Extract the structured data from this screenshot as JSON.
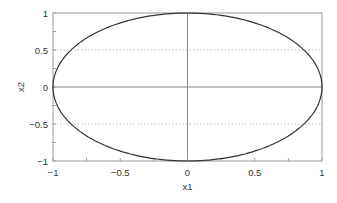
{
  "chart_data": {
    "type": "line",
    "title": "",
    "xlabel": "x1",
    "ylabel": "x2",
    "xlim": [
      -1,
      1
    ],
    "ylim": [
      -1,
      1
    ],
    "grid": {
      "horizontal_dotted_at": [
        -0.5,
        0.5
      ],
      "zero_lines": true
    },
    "x_ticks": [
      -1,
      -0.5,
      0,
      0.5,
      1
    ],
    "x_tick_labels": [
      "−1",
      "−0.5",
      "0",
      "0.5",
      "1"
    ],
    "y_ticks": [
      -1,
      -0.5,
      0,
      0.5,
      1
    ],
    "y_tick_labels": [
      "−1",
      "−0.5",
      "0",
      "0.5",
      "1"
    ],
    "minor_tick_step": 0.25,
    "series": [
      {
        "name": "unit circle x1^2 + x2^2 = 1",
        "equation": "x1^2 + x2^2 = 1",
        "x": [
          1,
          0.7071,
          0,
          -0.7071,
          -1,
          -0.7071,
          0,
          0.7071,
          1
        ],
        "y": [
          0,
          0.7071,
          1,
          0.7071,
          0,
          -0.7071,
          -1,
          -0.7071,
          0
        ],
        "color": "#333333"
      }
    ],
    "legend": null
  },
  "colors": {
    "curve": "#333333",
    "axes": "#999999",
    "grid": "#bbbbbb",
    "zero_lines": "#888888"
  }
}
